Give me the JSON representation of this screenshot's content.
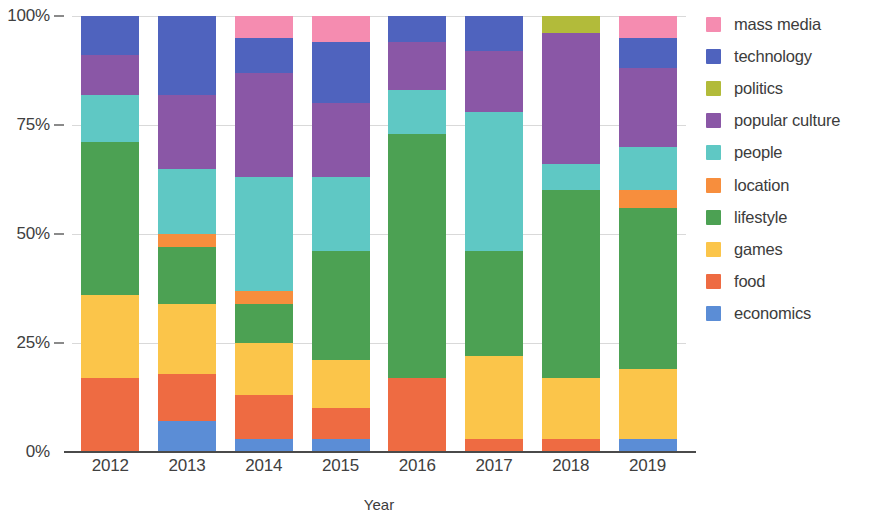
{
  "chart_data": {
    "type": "bar",
    "stacked": true,
    "normalized": true,
    "title": "",
    "xlabel": "Year",
    "ylabel": "",
    "categories": [
      "2012",
      "2013",
      "2014",
      "2015",
      "2016",
      "2017",
      "2018",
      "2019"
    ],
    "ylim": [
      0,
      100
    ],
    "yticks": [
      0,
      25,
      50,
      75,
      100
    ],
    "ytick_labels": [
      "0%",
      "25%",
      "50%",
      "75%",
      "100%"
    ],
    "grid": true,
    "legend_position": "right",
    "legend_order": [
      "mass media",
      "technology",
      "politics",
      "popular culture",
      "people",
      "location",
      "lifestyle",
      "games",
      "food",
      "economics"
    ],
    "stack_order": [
      "economics",
      "food",
      "games",
      "lifestyle",
      "location",
      "people",
      "popular culture",
      "politics",
      "technology",
      "mass media"
    ],
    "colors": {
      "mass media": "#F58CB0",
      "technology": "#4F63BE",
      "politics": "#B2BB3A",
      "popular culture": "#8A57A6",
      "people": "#5FC8C4",
      "location": "#F78E3D",
      "lifestyle": "#4CA153",
      "games": "#FAC košt"
    },
    "series": [
      {
        "name": "economics",
        "values": [
          0,
          7,
          3,
          3,
          0,
          0,
          0,
          3
        ]
      },
      {
        "name": "food",
        "values": [
          17,
          11,
          10,
          7,
          17,
          3,
          3,
          0
        ]
      },
      {
        "name": "games",
        "values": [
          19,
          16,
          12,
          11,
          0,
          19,
          14,
          16
        ]
      },
      {
        "name": "lifestyle",
        "values": [
          35,
          13,
          9,
          25,
          56,
          24,
          43,
          37
        ]
      },
      {
        "name": "location",
        "values": [
          0,
          3,
          3,
          0,
          0,
          0,
          0,
          4
        ]
      },
      {
        "name": "people",
        "values": [
          11,
          15,
          26,
          17,
          10,
          32,
          6,
          10
        ]
      },
      {
        "name": "popular culture",
        "values": [
          9,
          17,
          24,
          17,
          11,
          14,
          30,
          18
        ]
      },
      {
        "name": "politics",
        "values": [
          0,
          0,
          0,
          0,
          0,
          0,
          4,
          0
        ]
      },
      {
        "name": "technology",
        "values": [
          9,
          18,
          8,
          14,
          6,
          8,
          0,
          7
        ]
      },
      {
        "name": "mass media",
        "values": [
          0,
          0,
          5,
          6,
          0,
          0,
          0,
          5
        ]
      }
    ]
  },
  "legend": {
    "items": [
      {
        "label": "mass media",
        "color": "#F58CB0"
      },
      {
        "label": "technology",
        "color": "#4F63BE"
      },
      {
        "label": "politics",
        "color": "#B2BB3A"
      },
      {
        "label": "popular culture",
        "color": "#8A57A6"
      },
      {
        "label": "people",
        "color": "#5FC8C4"
      },
      {
        "label": "location",
        "color": "#F78E3D"
      },
      {
        "label": "lifestyle",
        "color": "#4CA153"
      },
      {
        "label": "games",
        "color": "#FBC54A"
      },
      {
        "label": "food",
        "color": "#EE6B42"
      },
      {
        "label": "economics",
        "color": "#5B8DD6"
      }
    ]
  },
  "axes": {
    "x_title": "Year",
    "y_tick_labels": [
      "100%",
      "75%",
      "50%",
      "25%",
      "0%"
    ],
    "x_tick_labels": [
      "2012",
      "2013",
      "2014",
      "2015",
      "2016",
      "2017",
      "2018",
      "2019"
    ]
  }
}
